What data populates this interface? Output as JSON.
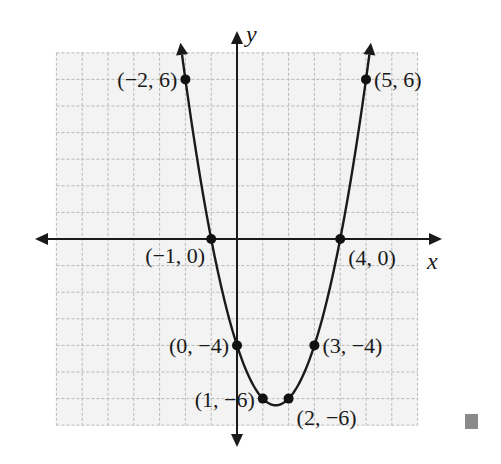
{
  "chart_data": {
    "type": "line",
    "title": "",
    "function": "y = x^2 - 3x - 4",
    "xlabel": "x",
    "ylabel": "y",
    "xlim": [
      -7,
      7
    ],
    "ylim": [
      -7,
      7
    ],
    "grid": true,
    "axes_arrows": true,
    "curve_arrows": true,
    "points": [
      {
        "x": -2,
        "y": 6,
        "label": "(−2, 6)",
        "label_pos": "left"
      },
      {
        "x": -1,
        "y": 0,
        "label": "(−1, 0)",
        "label_pos": "below-left"
      },
      {
        "x": 0,
        "y": -4,
        "label": "(0, −4)",
        "label_pos": "left"
      },
      {
        "x": 1,
        "y": -6,
        "label": "(1, −6)",
        "label_pos": "left"
      },
      {
        "x": 2,
        "y": -6,
        "label": "(2, −6)",
        "label_pos": "below-right"
      },
      {
        "x": 3,
        "y": -4,
        "label": "(3, −4)",
        "label_pos": "right"
      },
      {
        "x": 4,
        "y": 0,
        "label": "(4, 0)",
        "label_pos": "below-right"
      },
      {
        "x": 5,
        "y": 6,
        "label": "(5, 6)",
        "label_pos": "right"
      }
    ]
  },
  "colors": {
    "curve": "#1a1a1a",
    "grid": "#b8b8b8",
    "grid_bg": "#f3f3f3",
    "end_marker": "#8a8a8a"
  },
  "end_marker": "■"
}
